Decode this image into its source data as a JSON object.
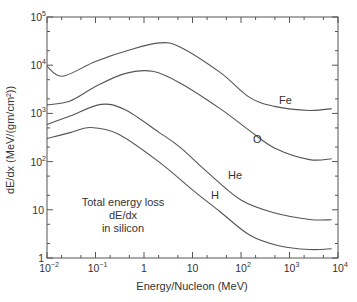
{
  "chart_data": {
    "type": "line",
    "title": "",
    "xlabel": "Energy/Nucleon (MeV)",
    "ylabel": "dE/dx (MeV/(gm/cm²))",
    "xscale": "log",
    "yscale": "log",
    "xlim": [
      0.01,
      10000
    ],
    "ylim": [
      1,
      100000
    ],
    "grid": false,
    "legend": "inline curve labels",
    "x_tick_labels": [
      "10⁻²",
      "10⁻¹",
      "1",
      "10",
      "10²",
      "10³",
      "10⁴"
    ],
    "y_tick_labels": [
      "1",
      "10",
      "10²",
      "10³",
      "10⁴",
      "10⁵"
    ],
    "annotation": [
      "Total energy loss",
      "dE/dx",
      "in silicon"
    ],
    "series": [
      {
        "name": "Fe",
        "x": [
          0.01,
          0.021,
          0.1,
          0.52,
          2.1,
          5.5,
          37,
          150,
          490,
          2600,
          7400
        ],
        "y": [
          9500,
          5900,
          12000,
          21000,
          29000,
          24000,
          7100,
          2150,
          1400,
          1150,
          1260
        ]
      },
      {
        "name": "O",
        "x": [
          0.01,
          0.03,
          0.1,
          0.4,
          1.5,
          5.5,
          37,
          150,
          500,
          2600,
          7400
        ],
        "y": [
          1500,
          1800,
          3600,
          6700,
          7500,
          4300,
          1260,
          440,
          190,
          110,
          115
        ]
      },
      {
        "name": "He",
        "x": [
          0.01,
          0.03,
          0.13,
          0.4,
          2,
          5.5,
          20,
          100,
          500,
          2600,
          7400
        ],
        "y": [
          590,
          880,
          1540,
          1200,
          410,
          200,
          61,
          16,
          8.6,
          6.3,
          6.2
        ]
      },
      {
        "name": "H",
        "x": [
          0.01,
          0.03,
          0.08,
          0.3,
          2,
          10,
          37,
          150,
          600,
          2600,
          7400
        ],
        "y": [
          300,
          400,
          510,
          370,
          100,
          26,
          9.1,
          3.0,
          1.8,
          1.5,
          1.55
        ]
      }
    ]
  },
  "labels": {
    "xlabel": "Energy/Nucleon (MeV)",
    "ylabel": "dE/dx (MeV/(gm/cm²))",
    "annot_line1": "Total energy loss",
    "annot_line2": "dE/dx",
    "annot_line3": "in silicon",
    "fe": "Fe",
    "o": "O",
    "he": "He",
    "h": "H"
  },
  "axes": {
    "x_ticks": [
      {
        "base": "10",
        "exp": "−2"
      },
      {
        "base": "10",
        "exp": "−1"
      },
      {
        "base": "1",
        "exp": ""
      },
      {
        "base": "10",
        "exp": ""
      },
      {
        "base": "10",
        "exp": "2"
      },
      {
        "base": "10",
        "exp": "3"
      },
      {
        "base": "10",
        "exp": "4"
      }
    ],
    "y_ticks": [
      {
        "base": "1",
        "exp": ""
      },
      {
        "base": "10",
        "exp": ""
      },
      {
        "base": "10",
        "exp": "2"
      },
      {
        "base": "10",
        "exp": "3"
      },
      {
        "base": "10",
        "exp": "4"
      },
      {
        "base": "10",
        "exp": "5"
      }
    ]
  },
  "colors": {
    "curve": "#555555",
    "axis": "#555555",
    "text": "#333333"
  }
}
